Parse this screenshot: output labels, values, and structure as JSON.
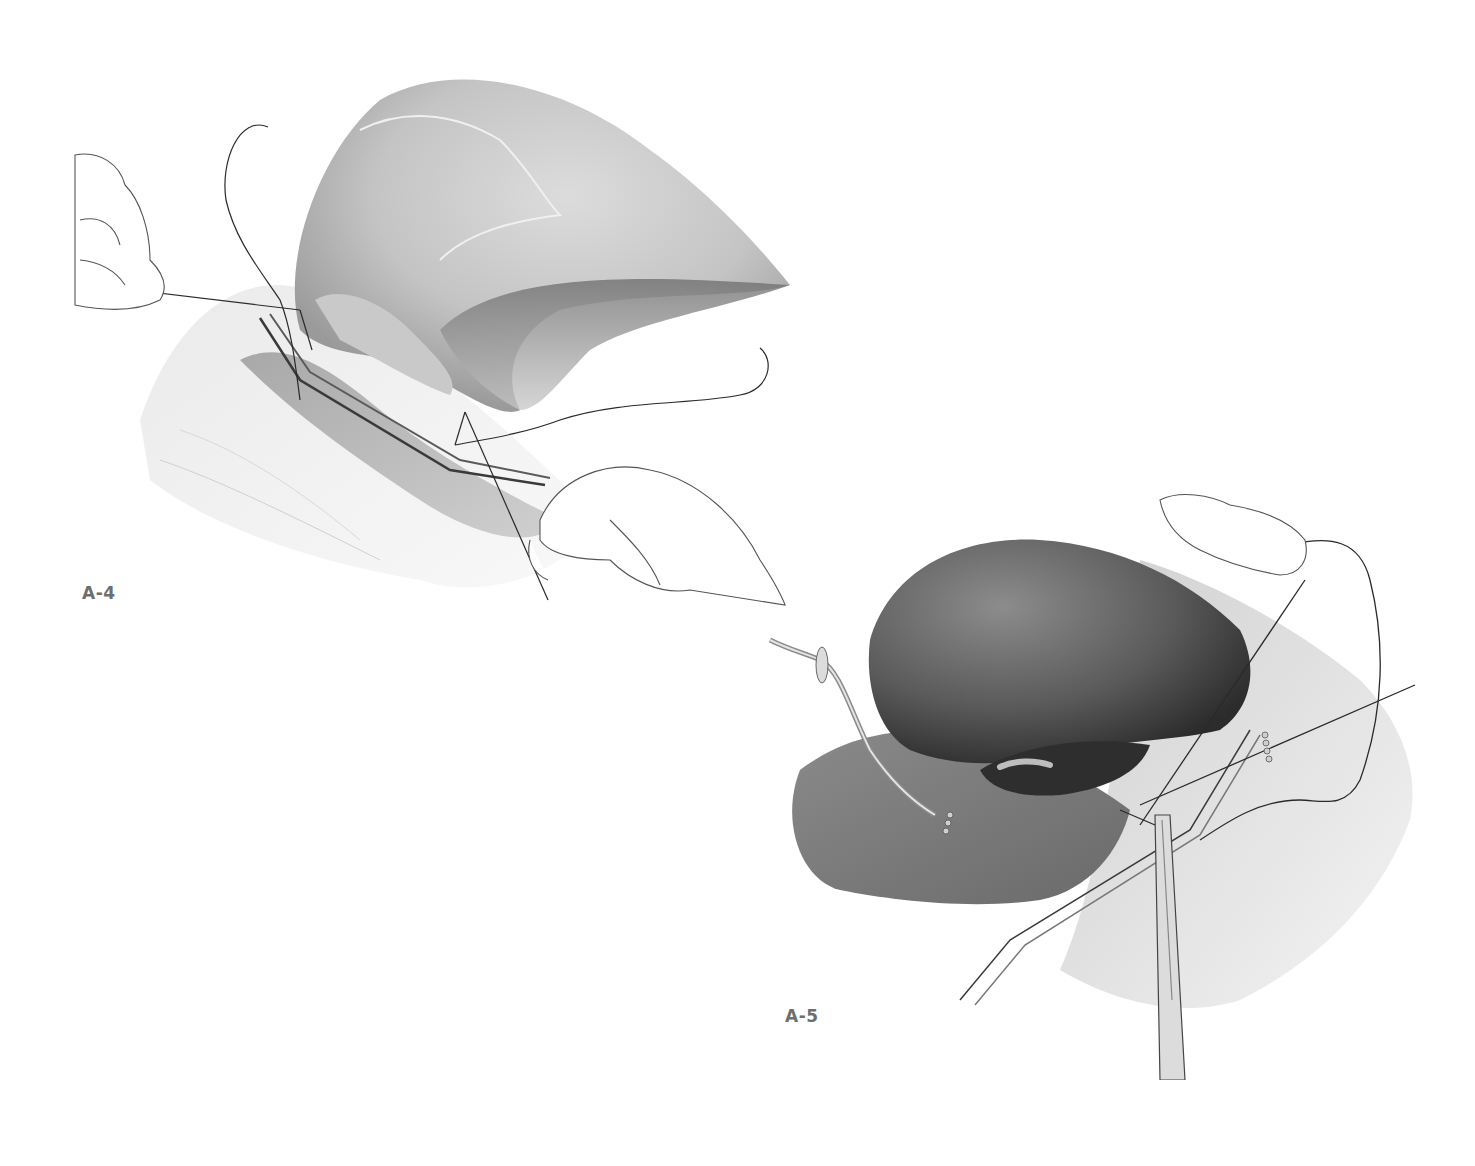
{
  "figure": {
    "background": "#ffffff",
    "panels": [
      {
        "id": "A-4",
        "label": "A-4",
        "label_color": "#6e6e6e",
        "content": "Surgical illustration: pale liver lobe held up, clamp on duct/vessel, sutures held by gloved hands (left and right)",
        "icons": [
          "liver-illustration",
          "vascular-clamp-icon",
          "suture-thread-icon",
          "gloved-hand-icon"
        ]
      },
      {
        "id": "A-5",
        "label": "A-5",
        "label_color": "#6e6e6e",
        "content": "Surgical illustration: dark liver lobe with gallbladder, catheter/drain tube at left, clamp and needle holder suturing anastomosis, gloved hand holding suture at top",
        "icons": [
          "liver-illustration",
          "drain-tube-icon",
          "needle-holder-icon",
          "forceps-icon",
          "suture-thread-icon",
          "gloved-hand-icon"
        ]
      }
    ]
  }
}
